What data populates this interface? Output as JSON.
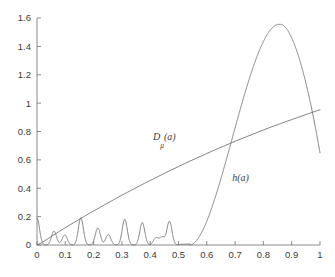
{
  "chart_data": {
    "type": "line",
    "title": "",
    "subtitle": "",
    "xlabel": "",
    "ylabel": "",
    "xlim": [
      0,
      1
    ],
    "ylim": [
      0,
      1.6
    ],
    "grid": false,
    "legend_position": "inline-annotations",
    "x_ticks": [
      "0",
      "0.1",
      "0.2",
      "0.3",
      "0.4",
      "0.5",
      "0.6",
      "0.7",
      "0.8",
      "0.9",
      "1"
    ],
    "x_tick_values": [
      0,
      0.1,
      0.2,
      0.3,
      0.4,
      0.5,
      0.6,
      0.7,
      0.8,
      0.9,
      1
    ],
    "y_ticks": [
      "0",
      "0.2",
      "0.4",
      "0.6",
      "0.8",
      "1",
      "1.2",
      "1.4",
      "1.6"
    ],
    "y_tick_values": [
      0,
      0.2,
      0.4,
      0.6,
      0.8,
      1,
      1.2,
      1.4,
      1.6
    ],
    "annotations": [
      {
        "text": "Dμ(a)",
        "base": "D",
        "sub": "μ",
        "tail": "(a)",
        "x": 0.41,
        "y": 0.74
      },
      {
        "text": "h(a)",
        "base": "h",
        "sub": "",
        "tail": "(a)",
        "x": 0.69,
        "y": 0.45
      }
    ],
    "series": [
      {
        "name": "Dμ(a)",
        "color": "#6e6e6e",
        "points": [
          [
            0.0,
            0.0
          ],
          [
            0.02,
            0.02
          ],
          [
            0.04,
            0.046
          ],
          [
            0.06,
            0.072
          ],
          [
            0.08,
            0.097
          ],
          [
            0.1,
            0.122
          ],
          [
            0.12,
            0.146
          ],
          [
            0.14,
            0.17
          ],
          [
            0.16,
            0.193
          ],
          [
            0.18,
            0.217
          ],
          [
            0.2,
            0.24
          ],
          [
            0.22,
            0.262
          ],
          [
            0.24,
            0.285
          ],
          [
            0.26,
            0.307
          ],
          [
            0.28,
            0.329
          ],
          [
            0.3,
            0.351
          ],
          [
            0.32,
            0.372
          ],
          [
            0.34,
            0.393
          ],
          [
            0.36,
            0.414
          ],
          [
            0.38,
            0.435
          ],
          [
            0.4,
            0.455
          ],
          [
            0.42,
            0.475
          ],
          [
            0.44,
            0.495
          ],
          [
            0.46,
            0.515
          ],
          [
            0.48,
            0.534
          ],
          [
            0.5,
            0.553
          ],
          [
            0.52,
            0.572
          ],
          [
            0.54,
            0.591
          ],
          [
            0.56,
            0.609
          ],
          [
            0.58,
            0.627
          ],
          [
            0.6,
            0.645
          ],
          [
            0.62,
            0.663
          ],
          [
            0.64,
            0.68
          ],
          [
            0.66,
            0.697
          ],
          [
            0.68,
            0.714
          ],
          [
            0.7,
            0.731
          ],
          [
            0.72,
            0.747
          ],
          [
            0.74,
            0.763
          ],
          [
            0.76,
            0.779
          ],
          [
            0.78,
            0.795
          ],
          [
            0.8,
            0.81
          ],
          [
            0.82,
            0.826
          ],
          [
            0.84,
            0.841
          ],
          [
            0.86,
            0.855
          ],
          [
            0.88,
            0.87
          ],
          [
            0.9,
            0.884
          ],
          [
            0.92,
            0.898
          ],
          [
            0.94,
            0.912
          ],
          [
            0.96,
            0.926
          ],
          [
            0.98,
            0.94
          ],
          [
            1.0,
            0.953
          ]
        ]
      },
      {
        "name": "h(a)",
        "color": "#6e6e6e",
        "peaks": [
          {
            "x": 0.0,
            "y": 0.19
          },
          {
            "x": 0.06,
            "y": 0.098
          },
          {
            "x": 0.098,
            "y": 0.072
          },
          {
            "x": 0.155,
            "y": 0.192
          },
          {
            "x": 0.215,
            "y": 0.12
          },
          {
            "x": 0.252,
            "y": 0.075
          },
          {
            "x": 0.31,
            "y": 0.182
          },
          {
            "x": 0.372,
            "y": 0.158
          },
          {
            "x": 0.42,
            "y": 0.05
          },
          {
            "x": 0.442,
            "y": 0.055
          },
          {
            "x": 0.468,
            "y": 0.168
          }
        ],
        "main_peak": {
          "x": 0.862,
          "y": 1.555
        },
        "rise_start": 0.54,
        "end_value": 0.65
      }
    ]
  },
  "axes": {
    "x_axis_name": "a-axis",
    "y_axis_name": "value-axis"
  }
}
